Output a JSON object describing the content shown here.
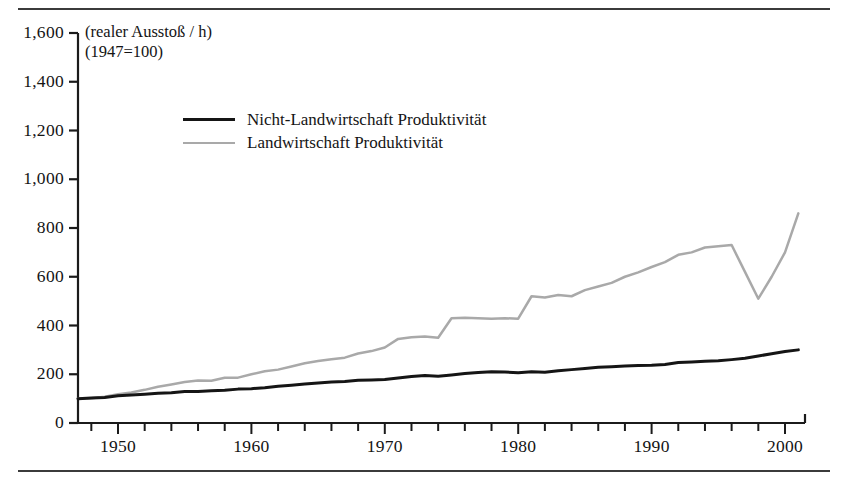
{
  "figure": {
    "axis_note_line1": "(realer Ausstoß / h)",
    "axis_note_line2": "(1947=100)"
  },
  "legend": {
    "items": [
      {
        "label": "Nicht-Landwirtschaft Produktivität",
        "color": "#151515",
        "key": "nonfarm"
      },
      {
        "label": "Landwirtschaft Produktivität",
        "color": "#a9a9a9",
        "key": "farm"
      }
    ]
  },
  "axes": {
    "y_ticks": [
      "0",
      "200",
      "400",
      "600",
      "800",
      "1,000",
      "1,200",
      "1,400",
      "1,600"
    ],
    "x_ticks": [
      "1950",
      "1960",
      "1970",
      "1980",
      "1990",
      "2000"
    ]
  },
  "chart_data": {
    "type": "line",
    "title": "",
    "subtitle": "(realer Ausstoß / h)  (1947=100)",
    "xlabel": "",
    "ylabel": "(realer Ausstoß / h) (1947=100)",
    "xlim": [
      1947,
      2001
    ],
    "ylim": [
      0,
      1600
    ],
    "grid": false,
    "legend_position": "inside-upper-left",
    "y_tick_values": [
      0,
      200,
      400,
      600,
      800,
      1000,
      1200,
      1400,
      1600
    ],
    "x_tick_values": [
      1950,
      1960,
      1970,
      1980,
      1990,
      2000
    ],
    "x_minor_tick_interval": 2,
    "x": [
      1947,
      1948,
      1949,
      1950,
      1951,
      1952,
      1953,
      1954,
      1955,
      1956,
      1957,
      1958,
      1959,
      1960,
      1961,
      1962,
      1963,
      1964,
      1965,
      1966,
      1967,
      1968,
      1969,
      1970,
      1971,
      1972,
      1973,
      1974,
      1975,
      1976,
      1977,
      1978,
      1979,
      1980,
      1981,
      1982,
      1983,
      1984,
      1985,
      1986,
      1987,
      1988,
      1989,
      1990,
      1991,
      1992,
      1993,
      1994,
      1995,
      1996,
      1997,
      1998,
      1999,
      2000,
      2001
    ],
    "series": [
      {
        "name": "Nicht-Landwirtschaft Produktivität",
        "color": "#151515",
        "values": [
          100,
          103,
          105,
          112,
          115,
          118,
          122,
          124,
          129,
          129,
          132,
          134,
          139,
          141,
          145,
          151,
          155,
          160,
          164,
          168,
          170,
          175,
          176,
          178,
          185,
          191,
          195,
          192,
          197,
          203,
          207,
          210,
          209,
          206,
          210,
          208,
          214,
          219,
          224,
          229,
          231,
          234,
          236,
          237,
          240,
          248,
          250,
          253,
          255,
          260,
          266,
          275,
          284,
          293,
          300
        ]
      },
      {
        "name": "Landwirtschaft Produktivität",
        "color": "#a9a9a9",
        "values": [
          100,
          102,
          108,
          118,
          125,
          136,
          149,
          158,
          168,
          174,
          173,
          186,
          186,
          200,
          212,
          219,
          232,
          245,
          254,
          262,
          268,
          285,
          295,
          310,
          345,
          352,
          355,
          350,
          430,
          432,
          430,
          428,
          430,
          428,
          520,
          515,
          525,
          520,
          545,
          560,
          575,
          600,
          618,
          640,
          660,
          690,
          700,
          720,
          725,
          730,
          620,
          510,
          600,
          700,
          860
        ]
      }
    ]
  }
}
